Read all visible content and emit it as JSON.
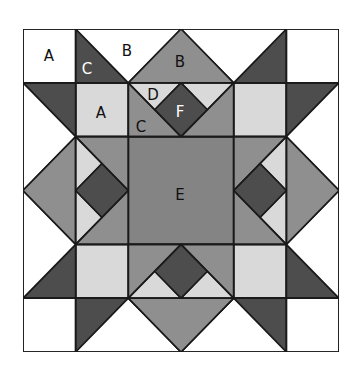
{
  "colors": {
    "white": "#ffffff",
    "light": "#d9d9d9",
    "medium": "#8f8f8f",
    "center": "#848484",
    "dark": "#4d4d4d",
    "line": "#1a1a1a"
  },
  "labels": {
    "a1": "A",
    "c1": "C",
    "b1": "B",
    "b2": "B",
    "d1": "D",
    "a2": "A",
    "c2": "C",
    "f1": "F",
    "e1": "E"
  }
}
